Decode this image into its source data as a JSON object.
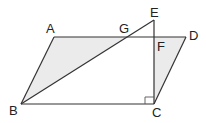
{
  "diagram": {
    "type": "geometry",
    "colors": {
      "stroke": "#333333",
      "shade": "#ebebeb",
      "label": "#222222",
      "background": "#ffffff"
    },
    "points": {
      "A": {
        "label": "A",
        "x": 54,
        "y": 37
      },
      "B": {
        "label": "B",
        "x": 21,
        "y": 104
      },
      "C": {
        "label": "C",
        "x": 154,
        "y": 104
      },
      "D": {
        "label": "D",
        "x": 186,
        "y": 37
      },
      "E": {
        "label": "E",
        "x": 154,
        "y": 20
      },
      "F": {
        "label": "F",
        "x": 154,
        "y": 37
      },
      "G": {
        "label": "G",
        "x": 127,
        "y": 37
      }
    },
    "segments": [
      "AB",
      "BC",
      "CD",
      "DA",
      "BE",
      "EC"
    ],
    "shaded_regions": [
      "ABG",
      "FDC"
    ],
    "right_angle": {
      "vertex": "C",
      "between": [
        "EC",
        "BC"
      ]
    }
  }
}
